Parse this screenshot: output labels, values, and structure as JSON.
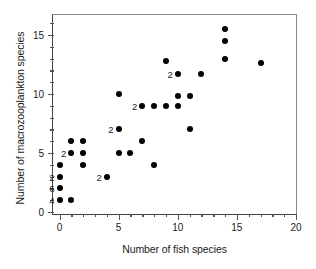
{
  "chart_data": {
    "type": "scatter",
    "title": "",
    "xlabel": "Number of fish species",
    "ylabel": "Number of macrozooplankton species",
    "xlim": [
      -1,
      20
    ],
    "ylim": [
      -0.6,
      16.4
    ],
    "xticks": [
      0,
      5,
      10,
      15,
      20
    ],
    "xticklabels": [
      "0",
      "5",
      "10",
      "15",
      "20"
    ],
    "yticks": [
      0,
      5,
      10,
      15
    ],
    "yticklabels": [
      "0",
      "5",
      "10",
      "15"
    ],
    "x_minor_tick_step": 1,
    "y_minor_tick_step": 1,
    "grid": false,
    "legend": null,
    "marker": "filled-circle",
    "marker_color": "#000000",
    "points": [
      {
        "x": 0,
        "y": 4,
        "count": 1,
        "label": ""
      },
      {
        "x": 0,
        "y": 3,
        "count": 2,
        "label": "2"
      },
      {
        "x": 0,
        "y": 2,
        "count": 6,
        "label": "6"
      },
      {
        "x": 0,
        "y": 1,
        "count": 4,
        "label": "4"
      },
      {
        "x": 1,
        "y": 6,
        "count": 1,
        "label": ""
      },
      {
        "x": 1,
        "y": 5,
        "count": 2,
        "label": "2"
      },
      {
        "x": 1,
        "y": 1,
        "count": 1,
        "label": ""
      },
      {
        "x": 2,
        "y": 6,
        "count": 1,
        "label": ""
      },
      {
        "x": 2,
        "y": 5,
        "count": 1,
        "label": ""
      },
      {
        "x": 2,
        "y": 4,
        "count": 1,
        "label": ""
      },
      {
        "x": 4,
        "y": 3,
        "count": 2,
        "label": "2"
      },
      {
        "x": 5,
        "y": 10,
        "count": 1,
        "label": ""
      },
      {
        "x": 5,
        "y": 7,
        "count": 2,
        "label": "2"
      },
      {
        "x": 5,
        "y": 5,
        "count": 1,
        "label": ""
      },
      {
        "x": 6,
        "y": 5,
        "count": 1,
        "label": ""
      },
      {
        "x": 7,
        "y": 9,
        "count": 2,
        "label": "2"
      },
      {
        "x": 7,
        "y": 6,
        "count": 1,
        "label": ""
      },
      {
        "x": 8,
        "y": 9,
        "count": 1,
        "label": ""
      },
      {
        "x": 8,
        "y": 4,
        "count": 1,
        "label": ""
      },
      {
        "x": 9,
        "y": 12.8,
        "count": 1,
        "label": ""
      },
      {
        "x": 9,
        "y": 9,
        "count": 1,
        "label": ""
      },
      {
        "x": 10,
        "y": 11.7,
        "count": 2,
        "label": "2"
      },
      {
        "x": 10,
        "y": 9.8,
        "count": 1,
        "label": ""
      },
      {
        "x": 10,
        "y": 9,
        "count": 1,
        "label": ""
      },
      {
        "x": 11,
        "y": 9.8,
        "count": 1,
        "label": ""
      },
      {
        "x": 11,
        "y": 7,
        "count": 1,
        "label": ""
      },
      {
        "x": 12,
        "y": 11.7,
        "count": 1,
        "label": ""
      },
      {
        "x": 14,
        "y": 15.5,
        "count": 1,
        "label": ""
      },
      {
        "x": 14,
        "y": 14.5,
        "count": 1,
        "label": ""
      },
      {
        "x": 14,
        "y": 13,
        "count": 1,
        "label": ""
      },
      {
        "x": 17,
        "y": 12.6,
        "count": 1,
        "label": ""
      }
    ]
  }
}
